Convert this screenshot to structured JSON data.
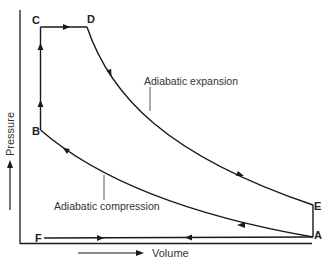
{
  "diagram": {
    "type": "pressure-volume cycle (Otto/Diesel-type indicator diagram)",
    "axes": {
      "x_label": "Volume",
      "y_label": "Pressure"
    },
    "points": {
      "A": "A",
      "B": "B",
      "C": "C",
      "D": "D",
      "E": "E",
      "F": "F"
    },
    "annotations": {
      "expansion": "Adiabatic expansion",
      "compression": "Adiabatic compression"
    },
    "paths": [
      {
        "from": "F",
        "to": "A",
        "kind": "horizontal line (intake)",
        "direction": "right"
      },
      {
        "from": "A",
        "to": "B",
        "kind": "adiabatic compression curve",
        "direction": "up-left"
      },
      {
        "from": "B",
        "to": "C",
        "kind": "vertical line",
        "direction": "up"
      },
      {
        "from": "C",
        "to": "D",
        "kind": "horizontal line (constant pressure)",
        "direction": "right"
      },
      {
        "from": "D",
        "to": "E",
        "kind": "adiabatic expansion curve",
        "direction": "down-right"
      },
      {
        "from": "E",
        "to": "A",
        "kind": "vertical line",
        "direction": "down"
      },
      {
        "from": "A",
        "to": "F",
        "kind": "horizontal line (exhaust)",
        "direction": "left"
      }
    ],
    "colors": {
      "line": "#1a1a1a",
      "text": "#222222",
      "background": "#ffffff"
    }
  }
}
